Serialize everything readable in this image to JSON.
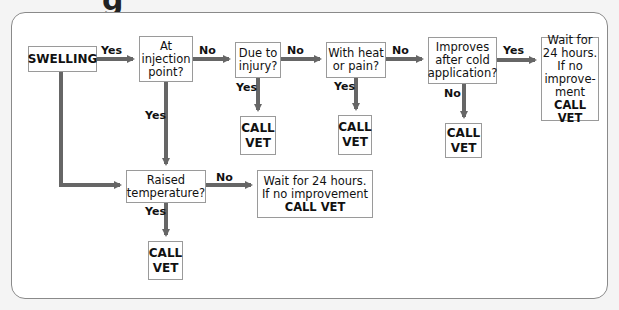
{
  "title_fragment": "g",
  "nodes": {
    "swelling": "SWELLING",
    "injection": [
      "At",
      "injection",
      "point?"
    ],
    "injury": [
      "Due to",
      "injury?"
    ],
    "heat": [
      "With heat",
      "or pain?"
    ],
    "cold": [
      "Improves",
      "after cold",
      "application?"
    ],
    "wait_right": [
      "Wait for",
      "24 hours.",
      "If no",
      "improve-",
      "ment"
    ],
    "wait_right_call": "CALL VET",
    "temperature": [
      "Raised",
      "temperature?"
    ],
    "wait_bottom": [
      "Wait for 24 hours.",
      "If no improvement"
    ],
    "wait_bottom_call": "CALL VET",
    "call_vet": [
      "CALL",
      "VET"
    ]
  },
  "edges": {
    "yes": "Yes",
    "no": "No"
  },
  "colors": {
    "arrow": "#666666",
    "box_border": "#9a9a9a"
  }
}
